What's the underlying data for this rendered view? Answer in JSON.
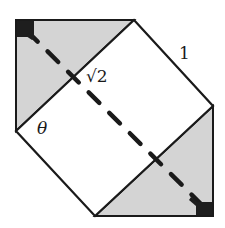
{
  "diagram": {
    "type": "folded-square-geometry",
    "colors": {
      "background": "#ffffff",
      "shaded_fill": "#d4d4d4",
      "stroke": "#1a1a1a",
      "corner_marker": "#1e1e1e",
      "dash": "#1a1a1a"
    },
    "labels": {
      "side_length": "1",
      "diagonal_length": "√2",
      "angle": "θ"
    },
    "shapes": {
      "hexagon_outline": [
        [
          16,
          20
        ],
        [
          134,
          20
        ],
        [
          213,
          106
        ],
        [
          213,
          216
        ],
        [
          95,
          216
        ],
        [
          16,
          131
        ]
      ],
      "upper_left_shaded_triangle": [
        [
          16,
          20
        ],
        [
          134,
          20
        ],
        [
          16,
          131
        ]
      ],
      "lower_right_shaded_triangle": [
        [
          213,
          106
        ],
        [
          213,
          216
        ],
        [
          95,
          216
        ]
      ],
      "inner_rectangle": [
        [
          134,
          20
        ],
        [
          213,
          106
        ],
        [
          95,
          216
        ],
        [
          16,
          131
        ]
      ],
      "dashed_diagonal": [
        [
          16,
          20
        ],
        [
          213,
          216
        ]
      ],
      "corner_markers": [
        {
          "name": "top-left",
          "x": 16,
          "y": 20
        },
        {
          "name": "bottom-right",
          "x": 213,
          "y": 216
        }
      ]
    }
  }
}
